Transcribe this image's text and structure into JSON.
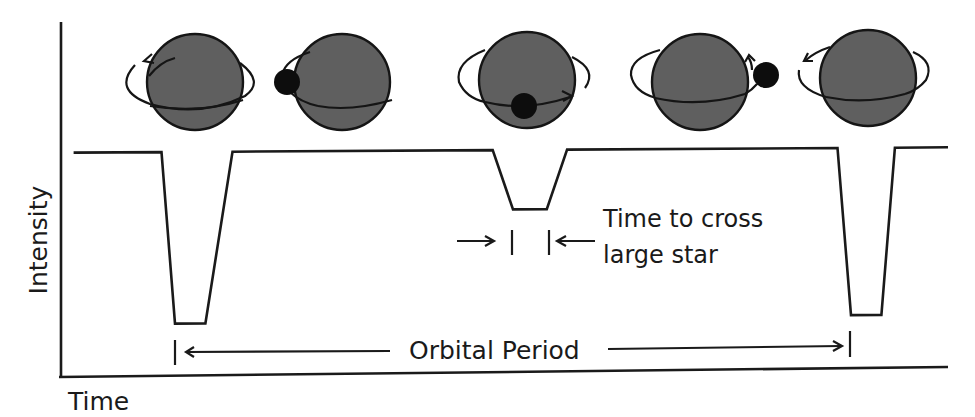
{
  "diagram": {
    "axes": {
      "y_label": "Intensity",
      "x_label": "Time"
    },
    "annotations": {
      "crossing_time_line1": "Time to cross",
      "crossing_time_line2": "large star",
      "orbital_period": "Orbital Period"
    },
    "phases": [
      {
        "id": "primary-eclipse-start",
        "companion_position": "behind-left",
        "orbit_arrow": "counterclockwise"
      },
      {
        "id": "companion-left",
        "companion_position": "left-edge",
        "orbit_arrow": "toward-front"
      },
      {
        "id": "secondary-transit",
        "companion_position": "in-front-center",
        "orbit_arrow": "right"
      },
      {
        "id": "companion-right",
        "companion_position": "right-edge",
        "orbit_arrow": "up-back"
      },
      {
        "id": "primary-eclipse-repeat",
        "companion_position": "behind-left",
        "orbit_arrow": "counterclockwise"
      }
    ],
    "colors": {
      "star_fill": "#5f5f5f",
      "companion_fill": "#0d0d0d",
      "stroke": "#1a1a1a",
      "background": "#ffffff"
    }
  },
  "chart_data": {
    "type": "line",
    "title": "",
    "xlabel": "Time",
    "ylabel": "Intensity",
    "x_units": "relative time (one orbital period = 1.0)",
    "y_units": "relative intensity (baseline = 1.0)",
    "xlim": [
      -0.15,
      1.15
    ],
    "ylim": [
      0.0,
      1.2
    ],
    "grid": false,
    "series": [
      {
        "name": "Light curve",
        "x": [
          -0.15,
          -0.02,
          0.0,
          0.045,
          0.085,
          0.47,
          0.5,
          0.55,
          0.58,
          0.98,
          1.0,
          1.045,
          1.065,
          1.15
        ],
        "y": [
          1.0,
          1.0,
          0.22,
          0.22,
          1.0,
          1.0,
          0.73,
          0.73,
          1.0,
          1.0,
          0.24,
          0.24,
          1.0,
          1.0
        ]
      }
    ],
    "dips": [
      {
        "name": "primary eclipse",
        "depth": 0.78
      },
      {
        "name": "secondary eclipse (transit across large star)",
        "depth": 0.27
      },
      {
        "name": "primary eclipse (next period)",
        "depth": 0.76
      }
    ]
  }
}
